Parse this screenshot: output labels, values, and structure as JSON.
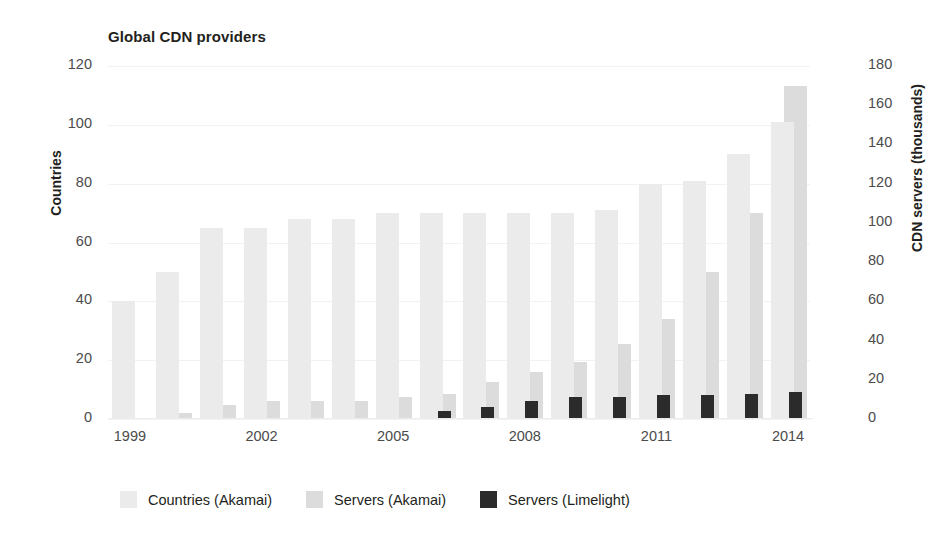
{
  "chart_data": {
    "type": "bar",
    "title": "Global CDN providers",
    "xlabel": "",
    "ylabel": "Countries",
    "y2label": "CDN servers (thousands)",
    "grid": true,
    "legend_position": "bottom",
    "ylim": [
      0,
      120
    ],
    "y2lim": [
      0,
      180
    ],
    "xlim": [
      1998.5,
      2014.5
    ],
    "yticks": [
      0,
      20,
      40,
      60,
      80,
      100,
      120
    ],
    "y2ticks": [
      0,
      20,
      40,
      60,
      80,
      100,
      120,
      140,
      160,
      180
    ],
    "xticks": [
      1999,
      2002,
      2005,
      2008,
      2011,
      2014
    ],
    "categories": [
      "1999",
      "2000",
      "2001",
      "2002",
      "2003",
      "2004",
      "2005",
      "2006",
      "2007",
      "2008",
      "2009",
      "2010",
      "2011",
      "2012",
      "2013",
      "2014"
    ],
    "series": [
      {
        "name": "Countries (Akamai)",
        "axis": "left",
        "color": "#ebebeb",
        "values": [
          40,
          50,
          65,
          65,
          68,
          68,
          70,
          70,
          70,
          70,
          70,
          71,
          80,
          81,
          90,
          101
        ]
      },
      {
        "name": "Servers (Akamai)",
        "axis": "right",
        "color": "#dcdcdc",
        "values": [
          0,
          3,
          7,
          9,
          9,
          9,
          11,
          13,
          19,
          24,
          29,
          38,
          51,
          75,
          105,
          170
        ]
      },
      {
        "name": "Servers (Limelight)",
        "axis": "right",
        "color": "#2b2b2b",
        "values": [
          0,
          0,
          0,
          0,
          0,
          0,
          0,
          4,
          6,
          9,
          11,
          11,
          12,
          12,
          13,
          14
        ]
      }
    ]
  },
  "legend": {
    "items": [
      {
        "label": "Countries (Akamai)",
        "color": "#ebebeb"
      },
      {
        "label": "Servers (Akamai)",
        "color": "#dcdcdc"
      },
      {
        "label": "Servers (Limelight)",
        "color": "#2b2b2b"
      }
    ]
  }
}
